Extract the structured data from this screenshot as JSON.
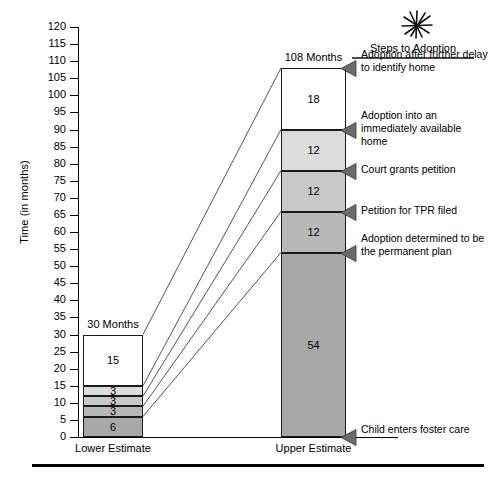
{
  "chart_data": {
    "type": "bar",
    "stacked": true,
    "title": "",
    "xlabel": "",
    "ylabel": "Time (in months)",
    "ylim": [
      0,
      120
    ],
    "ytick_step": 5,
    "yticks": [
      120,
      115,
      110,
      105,
      100,
      95,
      90,
      85,
      80,
      75,
      70,
      65,
      60,
      55,
      50,
      45,
      40,
      35,
      30,
      25,
      20,
      15,
      10,
      5,
      0
    ],
    "grid": false,
    "legend_position": "right",
    "legend_title": "Steps to Adoption",
    "categories": [
      "Lower Estimate",
      "Upper Estimate"
    ],
    "totals": [
      "30 Months",
      "108 Months"
    ],
    "series": [
      {
        "name": "Child enters foster care",
        "values": [
          6,
          54
        ],
        "order": 1
      },
      {
        "name": "Adoption determined to be the permanent plan",
        "values": [
          3,
          12
        ],
        "order": 2
      },
      {
        "name": "Petition for TPR filed",
        "values": [
          3,
          12
        ],
        "order": 3
      },
      {
        "name": "Court grants petition",
        "values": [
          3,
          12
        ],
        "order": 4
      },
      {
        "name": "Adoption into an immediately available home",
        "values": [
          15,
          18
        ],
        "order": 5
      }
    ],
    "segment_labels": {
      "lower": [
        "6",
        "3",
        "3",
        "3",
        "15"
      ],
      "upper": [
        "54",
        "12",
        "12",
        "12",
        "18"
      ]
    },
    "segment_colors": [
      "#a8a8a8",
      "#b8b8b8",
      "#c8c8c8",
      "#dcdcdc",
      "#ffffff"
    ],
    "annotations": [
      "Adoption after further delay to identify home",
      "Adoption into an immediately available home",
      "Court grants petition",
      "Petition for TPR filed",
      "Adoption determined to be the permanent plan",
      "Child enters foster care"
    ]
  },
  "axis": {
    "ylabel": "Time (in months)",
    "ticks": [
      "120",
      "115",
      "110",
      "105",
      "100",
      "95",
      "90",
      "85",
      "80",
      "75",
      "70",
      "65",
      "60",
      "55",
      "50",
      "45",
      "40",
      "35",
      "30",
      "25",
      "20",
      "15",
      "10",
      "5",
      "0"
    ]
  },
  "bars": {
    "lower": {
      "category": "Lower Estimate",
      "total_label": "30 Months",
      "segments": [
        {
          "label": "15",
          "value": 15,
          "base": 15
        },
        {
          "label": "3",
          "value": 3,
          "base": 12
        },
        {
          "label": "3",
          "value": 3,
          "base": 9
        },
        {
          "label": "3",
          "value": 3,
          "base": 6
        },
        {
          "label": "6",
          "value": 6,
          "base": 0
        }
      ]
    },
    "upper": {
      "category": "Upper Estimate",
      "total_label": "108 Months",
      "segments": [
        {
          "label": "18",
          "value": 18,
          "base": 90
        },
        {
          "label": "12",
          "value": 12,
          "base": 78
        },
        {
          "label": "12",
          "value": 12,
          "base": 66
        },
        {
          "label": "12",
          "value": 12,
          "base": 54
        },
        {
          "label": "54",
          "value": 54,
          "base": 0
        }
      ]
    }
  },
  "panel": {
    "title": "Steps to Adoption",
    "icon": "starburst-icon",
    "notes": [
      {
        "text": "Adoption after further delay to identify home",
        "anchor": 108
      },
      {
        "text": "Adoption into an immediately available home",
        "anchor": 90
      },
      {
        "text": "Court grants petition",
        "anchor": 78
      },
      {
        "text": "Petition for TPR filed",
        "anchor": 66
      },
      {
        "text": "Adoption determined to be the permanent plan",
        "anchor": 54
      },
      {
        "text": "Child enters foster care",
        "anchor": 0
      }
    ]
  }
}
